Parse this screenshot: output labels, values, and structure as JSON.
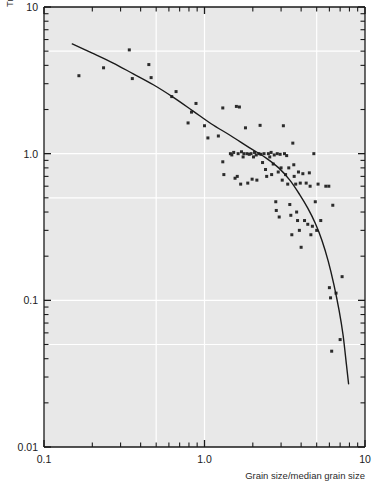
{
  "chart_data": {
    "type": "scatter",
    "title": "",
    "xlabel": "Grain size/median grain size",
    "ylabel": "Travel distance/travel distance of median grain size",
    "xscale": "log",
    "yscale": "log",
    "xlim": [
      0.1,
      10
    ],
    "ylim": [
      0.01,
      10
    ],
    "grid": true,
    "legend": "none",
    "xticklabels": [
      "0.1",
      "1.0",
      "10"
    ],
    "xtickvalues": [
      0.1,
      1.0,
      10
    ],
    "yticklabels": [
      "10",
      "1.0",
      "0.1",
      "0.01"
    ],
    "ytickvalues": [
      10,
      1.0,
      0.1,
      0.01
    ],
    "series": [
      {
        "name": "observations",
        "type": "scatter",
        "marker": "filled-square",
        "color": "#2b2b2b",
        "points": [
          [
            0.165,
            3.4
          ],
          [
            0.235,
            3.85
          ],
          [
            0.34,
            5.1
          ],
          [
            0.355,
            3.25
          ],
          [
            0.45,
            4.05
          ],
          [
            0.465,
            3.3
          ],
          [
            0.625,
            2.45
          ],
          [
            0.665,
            2.65
          ],
          [
            0.79,
            1.62
          ],
          [
            0.83,
            1.92
          ],
          [
            0.885,
            2.2
          ],
          [
            1.0,
            1.55
          ],
          [
            1.05,
            1.28
          ],
          [
            1.22,
            1.32
          ],
          [
            1.3,
            0.88
          ],
          [
            1.3,
            2.05
          ],
          [
            1.32,
            0.72
          ],
          [
            1.45,
            1.0
          ],
          [
            1.48,
            0.98
          ],
          [
            1.52,
            1.02
          ],
          [
            1.55,
            0.68
          ],
          [
            1.58,
            2.1
          ],
          [
            1.6,
            0.7
          ],
          [
            1.62,
            1.0
          ],
          [
            1.65,
            2.08
          ],
          [
            1.68,
            0.62
          ],
          [
            1.7,
            1.03
          ],
          [
            1.74,
            0.95
          ],
          [
            1.76,
            1.0
          ],
          [
            1.8,
            1.5
          ],
          [
            1.84,
            1.0
          ],
          [
            1.86,
            0.63
          ],
          [
            1.9,
            0.99
          ],
          [
            1.95,
            1.0
          ],
          [
            1.98,
            0.67
          ],
          [
            2.02,
            0.95
          ],
          [
            2.05,
            1.02
          ],
          [
            2.1,
            0.98
          ],
          [
            2.12,
            0.66
          ],
          [
            2.18,
            1.0
          ],
          [
            2.22,
            1.56
          ],
          [
            2.25,
            0.99
          ],
          [
            2.3,
            0.87
          ],
          [
            2.35,
            1.0
          ],
          [
            2.4,
            0.78
          ],
          [
            2.44,
            0.7
          ],
          [
            2.5,
            1.0
          ],
          [
            2.55,
            0.95
          ],
          [
            2.6,
            1.02
          ],
          [
            2.62,
            0.72
          ],
          [
            2.68,
            0.85
          ],
          [
            2.72,
            0.98
          ],
          [
            2.78,
            0.47
          ],
          [
            2.8,
            0.41
          ],
          [
            2.84,
            1.0
          ],
          [
            2.88,
            0.75
          ],
          [
            2.92,
            0.37
          ],
          [
            2.96,
            0.99
          ],
          [
            3.0,
            0.8
          ],
          [
            3.05,
            0.66
          ],
          [
            3.1,
            1.55
          ],
          [
            3.15,
            1.0
          ],
          [
            3.2,
            0.72
          ],
          [
            3.25,
            0.97
          ],
          [
            3.3,
            0.62
          ],
          [
            3.35,
            0.8
          ],
          [
            3.4,
            0.45
          ],
          [
            3.45,
            0.38
          ],
          [
            3.5,
            0.28
          ],
          [
            3.55,
            1.18
          ],
          [
            3.6,
            0.84
          ],
          [
            3.62,
            0.7
          ],
          [
            3.7,
            0.62
          ],
          [
            3.75,
            0.4
          ],
          [
            3.8,
            0.35
          ],
          [
            3.85,
            0.75
          ],
          [
            3.9,
            0.3
          ],
          [
            3.95,
            0.63
          ],
          [
            4.0,
            0.23
          ],
          [
            4.1,
            0.73
          ],
          [
            4.2,
            0.35
          ],
          [
            4.3,
            0.63
          ],
          [
            4.4,
            0.33
          ],
          [
            4.5,
            0.74
          ],
          [
            4.55,
            0.6
          ],
          [
            4.6,
            0.28
          ],
          [
            4.7,
            0.32
          ],
          [
            4.8,
            1.0
          ],
          [
            4.9,
            0.47
          ],
          [
            5.0,
            0.3
          ],
          [
            5.1,
            0.62
          ],
          [
            5.3,
            0.35
          ],
          [
            5.7,
            0.6
          ],
          [
            5.95,
            0.6
          ],
          [
            6.0,
            0.122
          ],
          [
            6.1,
            0.104
          ],
          [
            6.2,
            0.045
          ],
          [
            6.3,
            0.445
          ],
          [
            6.6,
            0.112
          ],
          [
            7.0,
            0.054
          ],
          [
            7.2,
            0.145
          ]
        ]
      },
      {
        "name": "fitted-curve",
        "type": "line",
        "color": "#1a1a1a",
        "points": [
          [
            0.15,
            5.6
          ],
          [
            0.2,
            4.85
          ],
          [
            0.27,
            4.15
          ],
          [
            0.36,
            3.5
          ],
          [
            0.48,
            2.95
          ],
          [
            0.64,
            2.42
          ],
          [
            0.85,
            1.95
          ],
          [
            1.1,
            1.6
          ],
          [
            1.45,
            1.33
          ],
          [
            1.9,
            1.1
          ],
          [
            2.4,
            0.94
          ],
          [
            2.9,
            0.8
          ],
          [
            3.4,
            0.66
          ],
          [
            3.9,
            0.53
          ],
          [
            4.4,
            0.425
          ],
          [
            4.9,
            0.335
          ],
          [
            5.4,
            0.255
          ],
          [
            5.9,
            0.185
          ],
          [
            6.4,
            0.128
          ],
          [
            6.9,
            0.085
          ],
          [
            7.3,
            0.058
          ],
          [
            7.65,
            0.037
          ],
          [
            7.9,
            0.027
          ]
        ]
      }
    ]
  },
  "figure": {
    "background": "#ffffff",
    "plot_background": "#e8e8e8",
    "grid_color": "#ffffff",
    "axis_color": "#1a1a1a",
    "marker_color": "#2b2b2b"
  }
}
